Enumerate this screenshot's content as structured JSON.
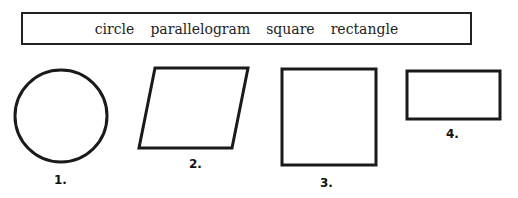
{
  "word_bank": {
    "words": [
      "circle",
      "parallelogram",
      "square",
      "rectangle"
    ]
  },
  "shapes": [
    {
      "number_label": "1.",
      "shape": "circle"
    },
    {
      "number_label": "2.",
      "shape": "parallelogram"
    },
    {
      "number_label": "3.",
      "shape": "square"
    },
    {
      "number_label": "4.",
      "shape": "rectangle"
    }
  ],
  "colors": {
    "stroke": "#1a1a1a",
    "background": "#ffffff"
  }
}
